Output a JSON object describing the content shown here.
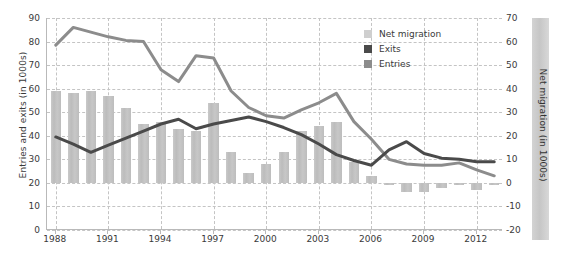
{
  "chart_data": {
    "type": "bar",
    "title": "",
    "xlabel": "",
    "ylabel": "Entries and exits (in 1000s)",
    "ylabel_right": "Net migration (in 1000s)",
    "ylim": [
      0,
      90
    ],
    "ylim_right": [
      -20,
      70
    ],
    "ytick_step": 10,
    "grid": true,
    "legend_position": "top-right",
    "x": [
      1988,
      1989,
      1990,
      1991,
      1992,
      1993,
      1994,
      1995,
      1996,
      1997,
      1998,
      1999,
      2000,
      2001,
      2002,
      2003,
      2004,
      2005,
      2006,
      2007,
      2008,
      2009,
      2010,
      2011,
      2012,
      2013
    ],
    "xticks": [
      "1988",
      "1991",
      "1994",
      "1997",
      "2000",
      "2003",
      "2006",
      "2009",
      "2012"
    ],
    "yticks_left": [
      "0",
      "10",
      "20",
      "30",
      "40",
      "50",
      "60",
      "70",
      "80",
      "90"
    ],
    "yticks_right": [
      "-20",
      "-10",
      "0",
      "10",
      "20",
      "30",
      "40",
      "50",
      "60",
      "70"
    ],
    "series": [
      {
        "name": "Net migration",
        "type": "bar",
        "axis": "right",
        "color": "#c4c4c4",
        "values": [
          39,
          38,
          39,
          37,
          32,
          25,
          26,
          23,
          22,
          34,
          13,
          4,
          8,
          13,
          22,
          24,
          26,
          9,
          3,
          -1,
          -4,
          -4,
          -2,
          -1,
          -3,
          -1
        ]
      },
      {
        "name": "Exits",
        "type": "line",
        "axis": "left",
        "color": "#4a4a4a",
        "values": [
          39.5,
          36.5,
          33,
          36,
          39,
          42,
          45,
          47,
          43,
          45,
          46.5,
          48,
          46,
          43.5,
          40.5,
          36.5,
          32,
          29.5,
          27.5,
          34,
          37.5,
          32.5,
          30.5,
          30,
          29,
          29
        ]
      },
      {
        "name": "Entries",
        "type": "line",
        "axis": "left",
        "color": "#8c8c8c",
        "values": [
          78.5,
          86,
          84,
          82,
          80.5,
          80,
          68,
          63,
          74,
          73,
          59,
          52,
          48.5,
          47.5,
          51,
          54,
          58,
          46,
          38.5,
          30,
          28,
          27.5,
          27.5,
          28.5,
          25.5,
          23
        ]
      }
    ]
  },
  "legend": {
    "items": [
      {
        "label": "Net migration",
        "color": "#cfcfcf"
      },
      {
        "label": "Exits",
        "color": "#4a4a4a"
      },
      {
        "label": "Entries",
        "color": "#8c8c8c"
      }
    ]
  },
  "axes": {
    "left_title": "Entries and exits (in 1000s)",
    "right_title": "Net migration (in 1000s)"
  }
}
